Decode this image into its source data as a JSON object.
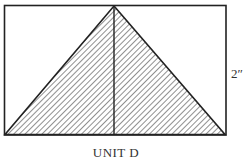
{
  "diagram": {
    "dimension_label": "2″",
    "caption": "UNIT D",
    "shapes": {
      "rectangle": {
        "x": 4,
        "y": 5,
        "width": 222,
        "height": 130
      },
      "triangle": {
        "apex": [
          114,
          6
        ],
        "base_left": [
          5,
          134
        ],
        "base_right": [
          225,
          134
        ],
        "fill": "diagonal-hatch"
      },
      "center_line": {
        "x": 114,
        "y1": 6,
        "y2": 134
      }
    },
    "colors": {
      "stroke": "#222222",
      "hatch": "#333333",
      "background": "#ffffff"
    }
  }
}
